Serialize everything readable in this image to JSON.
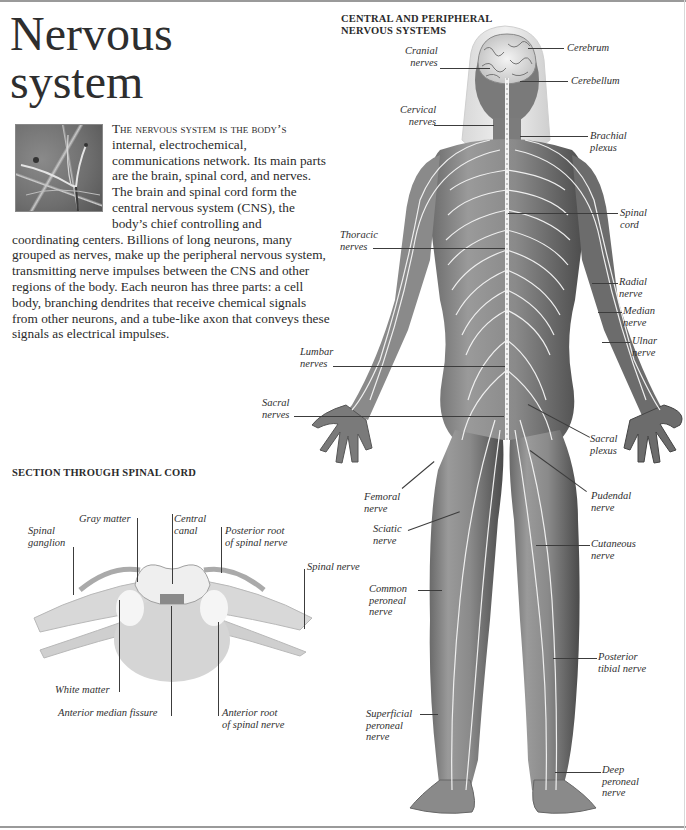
{
  "page": {
    "title_line1": "Nervous",
    "title_line2": "system"
  },
  "intro": {
    "lead_caps": "The nervous system is the body’s",
    "body": " internal, electrochemical, communications network. Its main parts are the brain, spinal cord, and nerves. The brain and spinal cord form the central nervous system (CNS), the body’s chief controlling and coordinating centers. Billions of long neurons, many grouped as nerves, make up the peripheral nervous system, transmitting nerve impulses between the CNS and other regions of the body. Each neuron has three parts: a cell body, branching dendrites that receive chemical signals from other neurons, and a tube-like axon that conveys these signals as electrical impulses."
  },
  "body_figure": {
    "heading_line1": "CENTRAL AND PERIPHERAL",
    "heading_line2": "NERVOUS SYSTEMS",
    "labels_left": [
      {
        "l1": "Cranial",
        "l2": "nerves"
      },
      {
        "l1": "Cervical",
        "l2": "nerves"
      },
      {
        "l1": "Thoracic",
        "l2": "nerves"
      },
      {
        "l1": "Lumbar",
        "l2": "nerves"
      },
      {
        "l1": "Sacral",
        "l2": "nerves"
      },
      {
        "l1": "Femoral",
        "l2": "nerve"
      },
      {
        "l1": "Sciatic",
        "l2": "nerve"
      },
      {
        "l1": "Common",
        "l2": "peroneal",
        "l3": "nerve"
      },
      {
        "l1": "Superficial",
        "l2": "peroneal",
        "l3": "nerve"
      }
    ],
    "labels_right": [
      {
        "l1": "Cerebrum"
      },
      {
        "l1": "Cerebellum"
      },
      {
        "l1": "Brachial",
        "l2": "plexus"
      },
      {
        "l1": "Spinal",
        "l2": "cord"
      },
      {
        "l1": "Radial",
        "l2": "nerve"
      },
      {
        "l1": "Median",
        "l2": "nerve"
      },
      {
        "l1": "Ulnar",
        "l2": "nerve"
      },
      {
        "l1": "Sacral",
        "l2": "plexus"
      },
      {
        "l1": "Pudendal",
        "l2": "nerve"
      },
      {
        "l1": "Cutaneous",
        "l2": "nerve"
      },
      {
        "l1": "Posterior",
        "l2": "tibial nerve"
      },
      {
        "l1": "Deep",
        "l2": "peroneal",
        "l3": "nerve"
      }
    ]
  },
  "spinal_section": {
    "heading": "SECTION THROUGH SPINAL CORD",
    "labels": [
      {
        "l1": "Spinal",
        "l2": "ganglion"
      },
      {
        "l1": "Gray matter"
      },
      {
        "l1": "Central",
        "l2": "canal"
      },
      {
        "l1": "Posterior root",
        "l2": "of spinal nerve"
      },
      {
        "l1": "Spinal nerve"
      },
      {
        "l1": "White matter"
      },
      {
        "l1": "Anterior median fissure"
      },
      {
        "l1": "Anterior root",
        "l2": "of spinal nerve"
      }
    ]
  },
  "colors": {
    "text": "#2b2b2b",
    "skin_dark": "#5a5a5a",
    "skin_mid": "#8c8c8c",
    "nerve": "#f2f2f2",
    "rule": "#9a9a9a"
  }
}
